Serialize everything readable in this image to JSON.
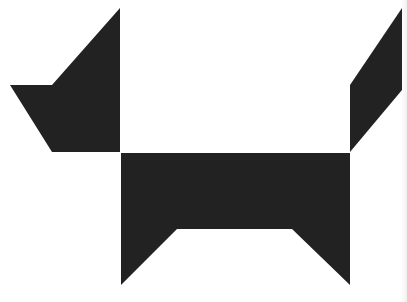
{
  "figure": {
    "fill_color": "#222222",
    "background_color": "#ffffff",
    "pieces": [
      {
        "name": "head",
        "points": "120,8 120,152 52,152 10,85 52,85"
      },
      {
        "name": "tail",
        "points": "402,8 402,90 350,152 350,85"
      },
      {
        "name": "body",
        "points": "121,153 350,153 350,285 292,229 177,229 121,285"
      }
    ]
  }
}
